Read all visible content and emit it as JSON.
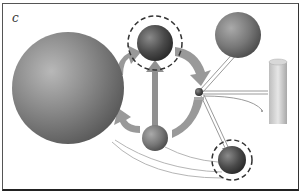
{
  "panel": {
    "label": "c"
  },
  "diagram": {
    "nodes": [
      {
        "id": "large-sphere",
        "shape": "sphere",
        "size": "large"
      },
      {
        "id": "top-sphere",
        "shape": "sphere",
        "size": "medium",
        "highlighted": true,
        "outline": "dashed-circle"
      },
      {
        "id": "right-sphere",
        "shape": "sphere",
        "size": "medium"
      },
      {
        "id": "center-sphere",
        "shape": "sphere",
        "size": "small"
      },
      {
        "id": "hub-node",
        "shape": "sphere",
        "size": "tiny"
      },
      {
        "id": "bottom-right-sphere",
        "shape": "sphere",
        "size": "small",
        "highlighted": true,
        "outline": "dashed-circle"
      },
      {
        "id": "cylinder",
        "shape": "cylinder"
      }
    ],
    "edges": [
      {
        "from": "center-sphere",
        "to": "top-sphere",
        "style": "thick-arrow"
      },
      {
        "from": "large-sphere",
        "to": "top-sphere",
        "style": "wide-curved-arrow"
      },
      {
        "from": "top-sphere",
        "to": "hub-node",
        "style": "wide-curved-arrow"
      },
      {
        "from": "hub-node",
        "to": "center-sphere",
        "style": "wide-curved-arrow"
      },
      {
        "from": "center-sphere",
        "to": "large-sphere",
        "style": "wide-curved-arrow"
      },
      {
        "from": "hub-node",
        "to": "right-sphere",
        "style": "double-line"
      },
      {
        "from": "hub-node",
        "to": "cylinder",
        "style": "double-line"
      },
      {
        "from": "hub-node",
        "to": "bottom-right-sphere",
        "style": "double-line-arrow"
      },
      {
        "from": "large-sphere",
        "to": "bottom-right-sphere",
        "style": "thin-curved-line"
      },
      {
        "from": "center-sphere",
        "to": "bottom-right-sphere",
        "style": "thin-curved-line"
      }
    ]
  },
  "colors": {
    "sphere": "#7a7a7a",
    "sphere_dark": "#3a3a3a",
    "arrow": "#8c8c8c",
    "line": "#b0b0b0",
    "dashed_outline": "#333333"
  }
}
